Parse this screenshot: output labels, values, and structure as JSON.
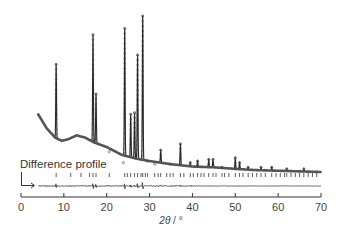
{
  "chart_data": {
    "type": "line",
    "title": "",
    "xlabel": "2θ / °",
    "ylabel": "",
    "xlim": [
      0,
      70
    ],
    "x_ticks": [
      0,
      10,
      20,
      30,
      40,
      50,
      60,
      70
    ],
    "grid": false,
    "legend": null,
    "annotations": [
      {
        "text": "Difference profile",
        "points_to": "difference curve"
      }
    ],
    "series": [
      {
        "name": "Observed / calculated powder XRD pattern (Rietveld fit)",
        "style": "markers+line",
        "background": {
          "x": [
            4,
            6,
            8,
            9.5,
            11,
            13,
            15,
            17,
            20,
            23.5,
            27,
            30,
            35,
            40,
            45,
            50,
            55,
            60,
            65,
            70
          ],
          "y_rel": [
            0.37,
            0.28,
            0.22,
            0.2,
            0.21,
            0.235,
            0.22,
            0.19,
            0.16,
            0.11,
            0.085,
            0.07,
            0.05,
            0.035,
            0.03,
            0.02,
            0.012,
            0.008,
            0.004,
            0.0
          ]
        },
        "peaks": [
          {
            "x": 8.2,
            "rel_intensity": 0.69
          },
          {
            "x": 16.8,
            "rel_intensity": 0.88
          },
          {
            "x": 17.5,
            "rel_intensity": 0.5
          },
          {
            "x": 20.6,
            "rel_intensity": 0.13
          },
          {
            "x": 23.9,
            "rel_intensity": 0.06
          },
          {
            "x": 24.2,
            "rel_intensity": 0.92
          },
          {
            "x": 25.6,
            "rel_intensity": 0.37
          },
          {
            "x": 26.5,
            "rel_intensity": 0.38
          },
          {
            "x": 27.2,
            "rel_intensity": 0.75
          },
          {
            "x": 28.4,
            "rel_intensity": 1.0
          },
          {
            "x": 29.5,
            "rel_intensity": 0.07
          },
          {
            "x": 31.2,
            "rel_intensity": 0.05
          },
          {
            "x": 32.6,
            "rel_intensity": 0.14
          },
          {
            "x": 34.8,
            "rel_intensity": 0.05
          },
          {
            "x": 37.2,
            "rel_intensity": 0.18
          },
          {
            "x": 39.5,
            "rel_intensity": 0.06
          },
          {
            "x": 41.2,
            "rel_intensity": 0.07
          },
          {
            "x": 43.8,
            "rel_intensity": 0.08
          },
          {
            "x": 44.8,
            "rel_intensity": 0.08
          },
          {
            "x": 46.9,
            "rel_intensity": 0.03
          },
          {
            "x": 50.0,
            "rel_intensity": 0.09
          },
          {
            "x": 51.0,
            "rel_intensity": 0.06
          },
          {
            "x": 53.0,
            "rel_intensity": 0.03
          },
          {
            "x": 56.0,
            "rel_intensity": 0.03
          },
          {
            "x": 58.5,
            "rel_intensity": 0.03
          },
          {
            "x": 62.0,
            "rel_intensity": 0.02
          },
          {
            "x": 66.0,
            "rel_intensity": 0.02
          }
        ]
      },
      {
        "name": "Bragg reflection positions",
        "style": "tick-marks",
        "x": [
          8.2,
          11.6,
          14.0,
          16.0,
          16.8,
          17.5,
          20.6,
          24.2,
          24.8,
          25.6,
          26.5,
          27.2,
          28.0,
          28.4,
          29.0,
          29.5,
          31.2,
          32.0,
          32.6,
          34.0,
          34.8,
          35.5,
          37.2,
          38.0,
          39.5,
          40.2,
          41.2,
          42.0,
          42.7,
          43.8,
          44.8,
          45.5,
          46.9,
          47.5,
          48.5,
          50.0,
          51.0,
          51.8,
          53.0,
          54.0,
          55.0,
          56.0,
          57.0,
          58.5,
          59.5,
          60.5,
          61.5,
          62.0,
          63.0,
          64.0,
          65.0,
          66.0,
          67.0,
          68.0,
          69.0
        ]
      },
      {
        "name": "Difference profile",
        "style": "line",
        "description": "Near-flat residual with small spikes at main peak positions (8.2, 17, 24–29, 37)"
      }
    ]
  },
  "annotation_label": "Difference profile",
  "x_axis_label_prefix": "2",
  "x_axis_label_theta": "θ",
  "x_axis_label_suffix": " / °",
  "tick_labels": [
    "0",
    "10",
    "20",
    "30",
    "40",
    "50",
    "60",
    "70"
  ]
}
